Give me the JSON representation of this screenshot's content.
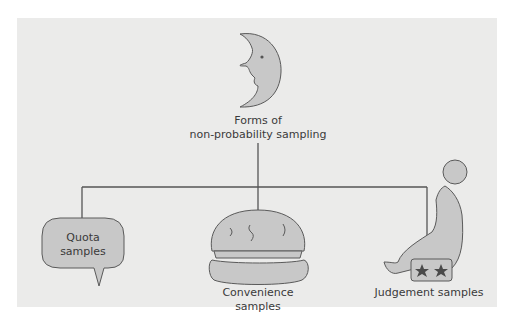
{
  "diagram": {
    "root": {
      "label_line1": "Forms of",
      "label_line2": "non-probability sampling",
      "icon": "crescent-moon-face"
    },
    "children": [
      {
        "label_line1": "Quota",
        "label_line2": "samples",
        "icon": "speech-bubble"
      },
      {
        "label": "Convenience samples",
        "icon": "hamburger"
      },
      {
        "label": "Judgement samples",
        "icon": "performing-seal"
      }
    ],
    "colors": {
      "panel": "#ebebea",
      "fill": "#c8c8c8",
      "stroke": "#5a5a5a",
      "line": "#555555",
      "star": "#4a4a4a",
      "text": "#3a3a3a"
    }
  }
}
